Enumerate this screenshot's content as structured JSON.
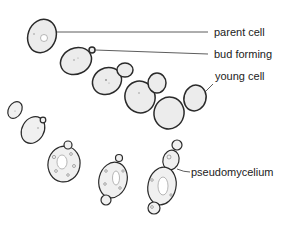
{
  "diagram": {
    "labels": {
      "parent_cell": "parent cell",
      "bud_forming": "bud forming",
      "young_cell": "young cell",
      "pseudomycelium": "pseudomycelium"
    }
  },
  "colors": {
    "outline": "#2a2a2a",
    "cell_fill": "#ececec",
    "text": "#222222",
    "background": "#ffffff"
  }
}
